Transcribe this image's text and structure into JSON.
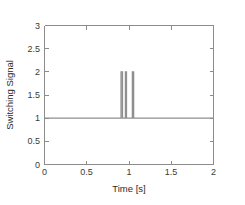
{
  "chart_data": {
    "type": "line",
    "title": "",
    "xlabel": "Time [s]",
    "ylabel": "Switching Signal",
    "xlim": [
      0,
      2
    ],
    "ylim": [
      0,
      3
    ],
    "grid": false,
    "legend": null,
    "xticks": [
      0,
      0.5,
      1,
      1.5,
      2
    ],
    "xticklabels": [
      "0",
      "0.5",
      "1",
      "1.5",
      "2"
    ],
    "yticks": [
      0,
      0.5,
      1,
      1.5,
      2,
      2.5,
      3
    ],
    "yticklabels": [
      "0",
      "0.5",
      "1",
      "1.5",
      "2",
      "2.5",
      "3"
    ],
    "baseline_value": 1,
    "pulse_value": 2,
    "pulses": [
      {
        "start": 0.906,
        "end": 0.923
      },
      {
        "start": 0.958,
        "end": 0.97
      },
      {
        "start": 1.04,
        "end": 1.055
      }
    ],
    "series": [
      {
        "name": "switching signal",
        "color": "#8f8f8f",
        "x": [
          0,
          0.906,
          0.906,
          0.923,
          0.923,
          0.958,
          0.958,
          0.97,
          0.97,
          1.04,
          1.04,
          1.055,
          1.055,
          2
        ],
        "y": [
          1,
          1,
          2,
          2,
          1,
          1,
          2,
          2,
          1,
          1,
          2,
          2,
          1,
          1
        ]
      }
    ]
  },
  "axes": {
    "x_axis_label": "Time [s]",
    "y_axis_label": "Switching Signal"
  }
}
